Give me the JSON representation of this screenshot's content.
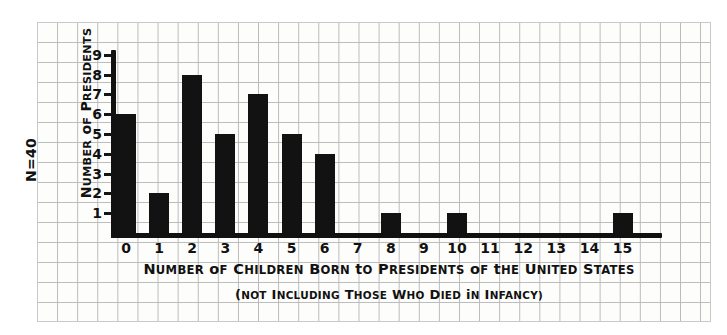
{
  "chart_data": {
    "type": "bar",
    "title": "Number of Children Born to Presidents of the United States",
    "subtitle": "(Not Including Those Who Died in Infancy)",
    "xlabel": "Number of Children Born to Presidents of the United States",
    "ylabel": "Number of Presidents",
    "annotation": "N=40",
    "categories": [
      0,
      1,
      2,
      3,
      4,
      5,
      6,
      7,
      8,
      9,
      10,
      11,
      12,
      13,
      14,
      15
    ],
    "values": [
      6,
      2,
      8,
      5,
      7,
      5,
      4,
      0,
      1,
      0,
      1,
      0,
      0,
      0,
      0,
      1
    ],
    "xtick_labels": [
      "0",
      "1",
      "2",
      "3",
      "4",
      "5",
      "6",
      "7",
      "8",
      "9",
      "10",
      "11",
      "12",
      "13",
      "14",
      "15"
    ],
    "ytick_labels": [
      "1",
      "2",
      "3",
      "4",
      "5",
      "6",
      "7",
      "8",
      "9"
    ],
    "ytick_values": [
      1,
      2,
      3,
      4,
      5,
      6,
      7,
      8,
      9
    ],
    "xlim": [
      -0.5,
      15.5
    ],
    "ylim": [
      0,
      9.5
    ],
    "grid": true,
    "legend": "none",
    "total_count": 40,
    "bar_color": "#121212",
    "axis_color": "#111111",
    "grid_color": "#b9b9b9",
    "paper_color": "#fdfdfc"
  },
  "ylabel_parts": {
    "n": "N",
    "eq40": "=40",
    "number": "N",
    "umber": "UMBER",
    "of": "OF",
    "p": "P",
    "residents": "RESIDENTS"
  },
  "title_parts": {
    "w1a": "N",
    "w1b": "UMBER",
    "w2": "OF",
    "w3a": "C",
    "w3b": "HILDREN",
    "w4a": "B",
    "w4b": "ORN",
    "w5a": "T",
    "w5b": "O",
    "w6a": "P",
    "w6b": "RESIDENTS",
    "w7": "OF",
    "w8": "THE",
    "w9a": "U",
    "w9b": "NITED",
    "w10a": "S",
    "w10b": "TATES"
  },
  "subtitle_parts": {
    "s1a": "(N",
    "s1b": "OT",
    "s2a": "I",
    "s2b": "NCLUDING",
    "s3": "THOSE",
    "s4": "WHO",
    "s5": "DIED",
    "s6": "IN",
    "s7a": "I",
    "s7b": "NFANCY)"
  }
}
